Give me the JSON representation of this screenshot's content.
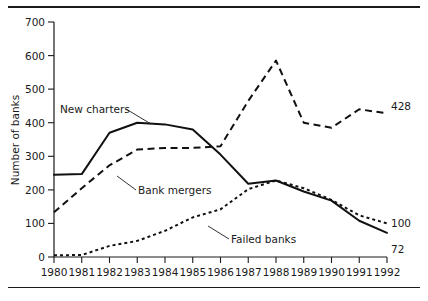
{
  "chart_data": {
    "type": "line",
    "title": "",
    "xlabel": "",
    "ylabel": "Number of banks",
    "x": [
      1980,
      1981,
      1982,
      1983,
      1984,
      1985,
      1986,
      1987,
      1988,
      1989,
      1990,
      1991,
      1992
    ],
    "xtick_labels": [
      "1980",
      "1981",
      "1982",
      "1983",
      "1984",
      "1985",
      "1986",
      "1987",
      "1988",
      "1989",
      "1990",
      "1991",
      "1992"
    ],
    "ytick_labels": [
      "0",
      "100",
      "200",
      "300",
      "400",
      "500",
      "600",
      "700"
    ],
    "yticks": [
      0,
      100,
      200,
      300,
      400,
      500,
      600,
      700
    ],
    "ylim": [
      0,
      700
    ],
    "xlim": [
      1980,
      1992
    ],
    "grid": false,
    "legend_position": "inline-annotations",
    "series": [
      {
        "name": "New charters",
        "style": "solid",
        "values": [
          245,
          247,
          370,
          400,
          395,
          380,
          305,
          218,
          228,
          195,
          168,
          108,
          72
        ],
        "end_label": "72"
      },
      {
        "name": "Bank mergers",
        "style": "dashed",
        "values": [
          133,
          205,
          273,
          320,
          325,
          325,
          330,
          465,
          585,
          400,
          385,
          440,
          428
        ],
        "end_label": "428"
      },
      {
        "name": "Failed banks",
        "style": "dotted",
        "values": [
          5,
          6,
          33,
          48,
          78,
          118,
          142,
          202,
          228,
          205,
          170,
          124,
          100
        ],
        "end_label": "100"
      }
    ],
    "annotations": [
      {
        "text": "New charters",
        "series": "New charters"
      },
      {
        "text": "Bank mergers",
        "series": "Bank mergers"
      },
      {
        "text": "Failed banks",
        "series": "Failed banks"
      }
    ],
    "end_labels": [
      "428",
      "100",
      "72"
    ]
  }
}
